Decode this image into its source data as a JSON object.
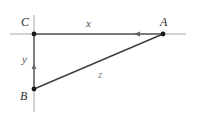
{
  "figure": {
    "type": "geometry-diagram",
    "background_color": "#ffffff",
    "line_color": "#555555",
    "axis_color": "#9a9a9a",
    "label_color": "#2b2b2b",
    "vertices": [
      {
        "id": "C",
        "label": "C",
        "x": 34,
        "y": 34
      },
      {
        "id": "A",
        "label": "A",
        "x": 163,
        "y": 34
      },
      {
        "id": "B",
        "label": "B",
        "x": 34,
        "y": 89
      }
    ],
    "sides": [
      {
        "id": "x",
        "label": "x",
        "from": "C",
        "to": "A",
        "orientation": "horizontal"
      },
      {
        "id": "y",
        "label": "y",
        "from": "B",
        "to": "C",
        "orientation": "vertical"
      },
      {
        "id": "z",
        "label": "z",
        "from": "B",
        "to": "A",
        "orientation": "diagonal"
      }
    ],
    "arrows": [
      {
        "on": "x",
        "direction": "left",
        "at_x": 136,
        "at_y": 34
      },
      {
        "on": "y",
        "direction": "up",
        "at_x": 34,
        "at_y": 68
      }
    ],
    "axes": {
      "horizontal_extent": [
        10,
        186
      ],
      "vertical_extent": [
        15,
        112
      ]
    }
  }
}
